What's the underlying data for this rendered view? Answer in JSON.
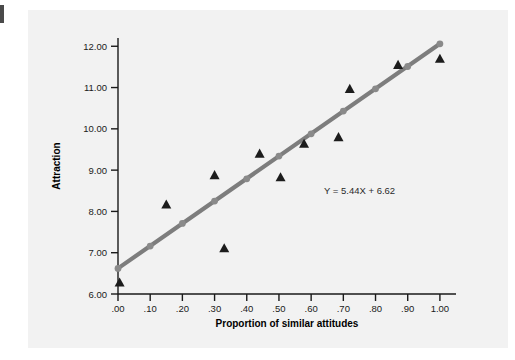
{
  "figure": {
    "background_color": "#ffffff",
    "panel_color": "#f2f2f2",
    "edge_mark_color": "#4a4a4a"
  },
  "chart_data": {
    "type": "scatter",
    "title": "",
    "xlabel": "Proportion of similar attitudes",
    "ylabel": "Attraction",
    "xlim": [
      0.0,
      1.05
    ],
    "ylim": [
      6.0,
      12.2
    ],
    "grid": false,
    "legend": null,
    "xticks": [
      0.0,
      0.1,
      0.2,
      0.3,
      0.4,
      0.5,
      0.6,
      0.7,
      0.8,
      0.9,
      1.0
    ],
    "xticklabels": [
      ".00",
      ".10",
      ".20",
      ".30",
      ".40",
      ".50",
      ".60",
      ".70",
      ".80",
      ".90",
      "1.00"
    ],
    "yticks": [
      6.0,
      7.0,
      8.0,
      9.0,
      10.0,
      11.0,
      12.0
    ],
    "yticklabels": [
      "6.00",
      "7.00",
      "8.00",
      "9.00",
      "10.00",
      "11.00",
      "12.00"
    ],
    "annotations": [
      {
        "text": "Y = 5.44X + 6.62",
        "x": 0.64,
        "y": 8.42,
        "color": "#2b2b2b"
      }
    ],
    "series": [
      {
        "name": "observed",
        "marker": "triangle",
        "color": "#1c1c1c",
        "points": [
          {
            "x": 0.005,
            "y": 6.28
          },
          {
            "x": 0.15,
            "y": 8.17
          },
          {
            "x": 0.3,
            "y": 8.88
          },
          {
            "x": 0.33,
            "y": 7.11
          },
          {
            "x": 0.44,
            "y": 9.4
          },
          {
            "x": 0.505,
            "y": 8.83
          },
          {
            "x": 0.578,
            "y": 9.64
          },
          {
            "x": 0.685,
            "y": 9.8
          },
          {
            "x": 0.72,
            "y": 10.97
          },
          {
            "x": 0.87,
            "y": 11.55
          },
          {
            "x": 1.0,
            "y": 11.7
          }
        ]
      },
      {
        "name": "regression-line",
        "marker": "circle",
        "color": "#8a8a8a",
        "line_color": "#7d7d7d",
        "slope": 5.44,
        "intercept": 6.62,
        "points": [
          {
            "x": 0.0,
            "y": 6.62
          },
          {
            "x": 0.1,
            "y": 7.16
          },
          {
            "x": 0.2,
            "y": 7.71
          },
          {
            "x": 0.3,
            "y": 8.25
          },
          {
            "x": 0.4,
            "y": 8.79
          },
          {
            "x": 0.5,
            "y": 9.34
          },
          {
            "x": 0.6,
            "y": 9.88
          },
          {
            "x": 0.7,
            "y": 10.43
          },
          {
            "x": 0.8,
            "y": 10.97
          },
          {
            "x": 0.9,
            "y": 11.51
          },
          {
            "x": 1.0,
            "y": 12.06
          }
        ]
      }
    ]
  }
}
